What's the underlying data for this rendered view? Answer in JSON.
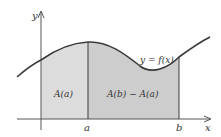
{
  "diagram": {
    "axes": {
      "x_label": "x",
      "y_label": "y"
    },
    "curve_label": "y = f(x)",
    "ticks": {
      "a": "a",
      "b": "b"
    },
    "regions": [
      {
        "label": "A(a)",
        "fill": "#dcdcdc"
      },
      {
        "label": "A(b) − A(a)",
        "fill": "#cdcdcd"
      }
    ],
    "colors": {
      "curve": "#3a3a3a",
      "axis": "#555555",
      "divider": "#3a3a3a",
      "text": "#333333"
    }
  }
}
